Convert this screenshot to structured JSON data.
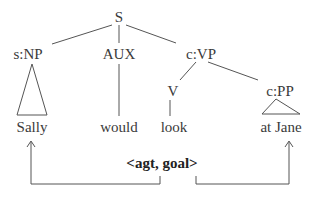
{
  "tree": {
    "root": "S",
    "nodes": {
      "subject_np": "s:NP",
      "aux": "AUX",
      "vp": "c:VP",
      "verb": "V",
      "pp": "c:PP"
    },
    "leaves": {
      "sally": "Sally",
      "would": "would",
      "look": "look",
      "at_jane": "at Jane"
    }
  },
  "role_frame": "<agt, goal>",
  "colors": {
    "line": "#555555",
    "text": "#3a3a3a"
  }
}
